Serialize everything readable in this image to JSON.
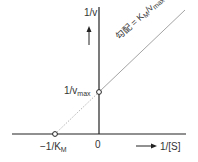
{
  "diagram": {
    "type": "Lineweaver-Burk plot",
    "y_axis_label": "1/v",
    "x_axis_label": "1/[S]",
    "origin_label": "0",
    "y_intercept": {
      "main": "1/v",
      "sub": "max"
    },
    "x_intercept": {
      "main": "−1/K",
      "sub": "M"
    },
    "slope_label": {
      "prefix": "勾配 = K",
      "sub1": "M",
      "mid": "/v",
      "sub2": "max"
    },
    "colors": {
      "axis": "#222222",
      "line": "#999999",
      "text": "#333333"
    }
  }
}
